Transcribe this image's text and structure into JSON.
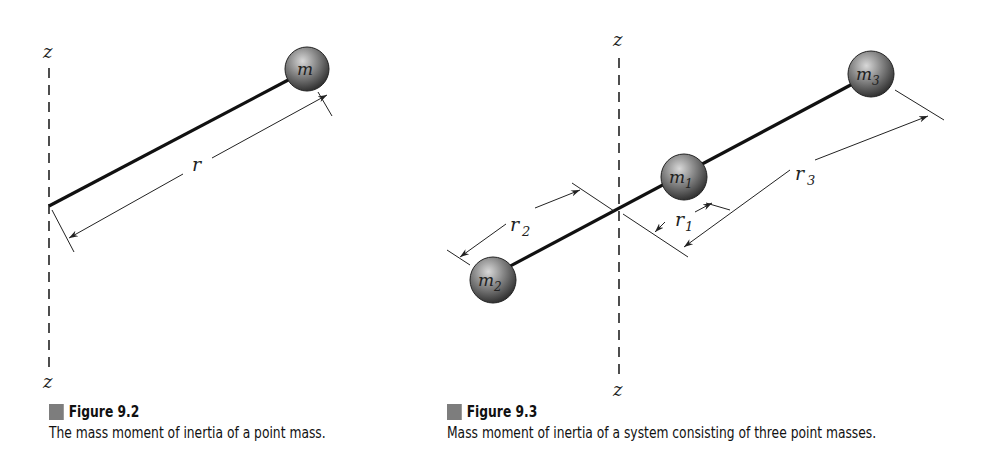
{
  "figures": [
    {
      "id": "9.2",
      "title": "Figure 9.2",
      "caption": "The mass moment of inertia of a point mass.",
      "axis_label_top": "z",
      "axis_label_bottom": "z",
      "mass_label": "m",
      "distance_label": "r"
    },
    {
      "id": "9.3",
      "title": "Figure 9.3",
      "caption": "Mass moment of inertia of a system consisting of three point masses.",
      "axis_label_top": "z",
      "axis_label_bottom": "z",
      "masses": [
        {
          "label": "m",
          "sub": "1"
        },
        {
          "label": "m",
          "sub": "2"
        },
        {
          "label": "m",
          "sub": "3"
        }
      ],
      "distances": [
        {
          "label": "r",
          "sub": "1"
        },
        {
          "label": "r",
          "sub": "2"
        },
        {
          "label": "r",
          "sub": "3"
        }
      ]
    }
  ],
  "colors": {
    "sphere_dark": "#3a3a3a",
    "sphere_light": "#b8b8b8",
    "caption_square": "#7d7d7d",
    "line": "#111111"
  }
}
